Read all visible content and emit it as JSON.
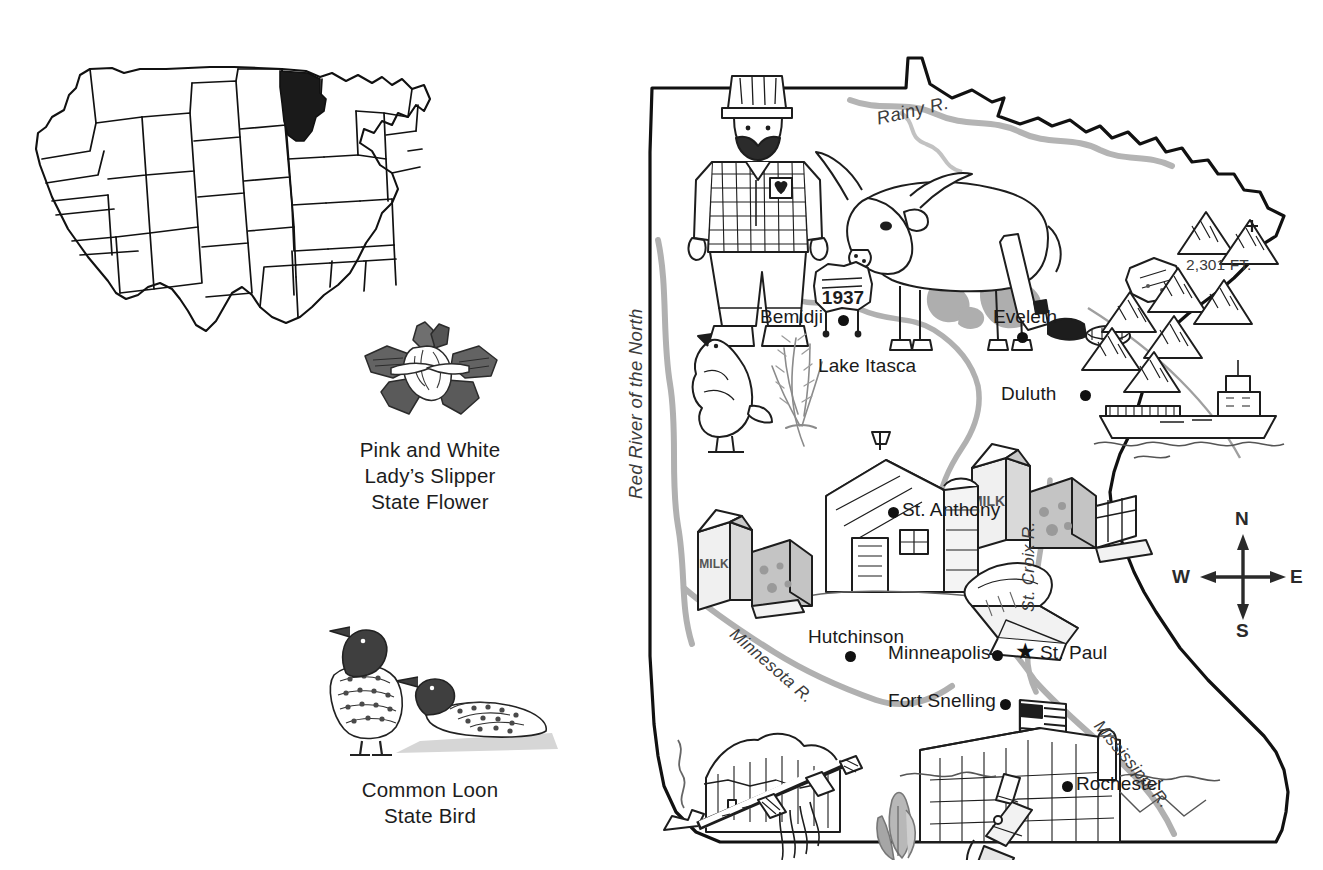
{
  "page": {
    "subject": "Minnesota",
    "background": "#ffffff",
    "ink": "#1a1a1a",
    "river_ink": "#9a9a9a"
  },
  "inset_map": {
    "name": "united-states-map",
    "highlighted_state": "Minnesota",
    "highlight_color": "#1a1a1a"
  },
  "symbols": [
    {
      "art": "pink-and-white-ladys-slipper",
      "caption_lines": [
        "Pink and White",
        "Lady’s Slipper",
        "State Flower"
      ]
    },
    {
      "art": "common-loon",
      "caption_lines": [
        "Common Loon",
        "State Bird"
      ]
    }
  ],
  "map": {
    "title": "Minnesota",
    "cities": [
      {
        "label": "Bemidji",
        "marker": "dot"
      },
      {
        "label": "Eveleth",
        "marker": "dot"
      },
      {
        "label": "Duluth",
        "marker": "dot"
      },
      {
        "label": "St. Anthony",
        "marker": "dot"
      },
      {
        "label": "Hutchinson",
        "marker": "dot"
      },
      {
        "label": "Minneapolis",
        "marker": "dot"
      },
      {
        "label": "St. Paul",
        "marker": "star"
      },
      {
        "label": "Fort Snelling",
        "marker": "dot"
      },
      {
        "label": "Rochester",
        "marker": "dot"
      }
    ],
    "features": [
      {
        "label": "Lake Itasca"
      },
      {
        "label": "2,301 FT."
      }
    ],
    "rivers": [
      {
        "label": "Rainy R."
      },
      {
        "label": "Red River of the North"
      },
      {
        "label": "St. Croix R."
      },
      {
        "label": "Minnesota R."
      },
      {
        "label": "Mississippi R."
      }
    ],
    "illustrations": [
      "paul-bunyan",
      "babe-the-blue-ox",
      "1937-sign",
      "prairie-chicken",
      "wheat-sheaf",
      "hockey-stick-and-puck",
      "iron-ore-chunk",
      "iron-range-mountains",
      "ore-freighter-ship",
      "milk-carton",
      "cheese-wedge",
      "dairy-barn",
      "grain-elevator",
      "canoe",
      "fort-snelling-flag",
      "fort-snelling-buildings",
      "pipestone-quarry",
      "peace-pipe",
      "corn-husk",
      "microscope"
    ],
    "sign_year": "1937"
  },
  "compass": {
    "north": "N",
    "south": "S",
    "east": "E",
    "west": "W"
  }
}
